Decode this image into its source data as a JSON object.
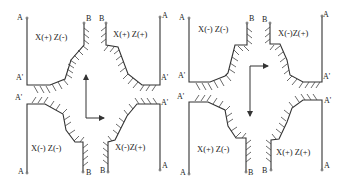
{
  "diagrams": [
    {
      "id": "left",
      "quadrants": {
        "top_left": "X(+) Z(-)",
        "top_right": "X(+) Z(+)",
        "bottom_left": "X(-) Z(-)",
        "bottom_right": "X(-)Z(+)"
      },
      "arrow": "up-then-right",
      "points": {
        "A": "A",
        "A_prime": "A'",
        "B": "B"
      }
    },
    {
      "id": "right",
      "quadrants": {
        "top_left": "X(-) Z(-)",
        "top_right": "X(-)Z(+)",
        "bottom_left": "X(+) Z(-)",
        "bottom_right": "X(+) Z(+)"
      },
      "arrow": "right-origin-down",
      "points": {
        "A": "A",
        "A_prime": "A'",
        "B": "B"
      }
    }
  ],
  "colors": {
    "line": "#333333",
    "hatch": "#444444",
    "background": "#ffffff"
  }
}
